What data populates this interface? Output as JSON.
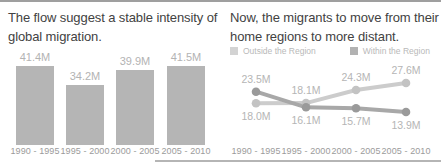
{
  "window": {
    "background": "#ffffff",
    "top_rule_color": "#9f9f9f",
    "bottom_rule_color": "#b5b5b5",
    "title_color": "#424242"
  },
  "chart_data": [
    {
      "type": "bar",
      "title": "The flow suggest a stable intensity of global migration.",
      "categories": [
        "1990 - 1995",
        "1995 - 2000",
        "2000 - 2005",
        "2005 - 2010"
      ],
      "values": [
        41.4,
        34.2,
        39.9,
        41.5
      ],
      "value_labels": [
        "41.4M",
        "34.2M",
        "39.9M",
        "41.5M"
      ],
      "unit": "M",
      "bar_color": "#b5b5b5",
      "label_color": "#b3b3b3",
      "axis_label_color": "#9b9b9b",
      "grid": false,
      "y_axis_shown": false
    },
    {
      "type": "line",
      "title": "Now, the migrants to move from their home regions to more distant.",
      "categories": [
        "1990 - 1995",
        "1995 - 2000",
        "2000 - 2005",
        "2005 - 2010"
      ],
      "legend_position": "top",
      "legend": [
        {
          "name": "Outside the Region",
          "color": "#d3d3d3"
        },
        {
          "name": "Within the Region",
          "color": "#b2b2b2"
        }
      ],
      "value_label_color": "#b5b5b5",
      "axis_label_color": "#9b9b9b",
      "grid": false,
      "series": [
        {
          "name": "Outside the Region",
          "values": [
            18.0,
            18.1,
            24.3,
            27.6
          ],
          "value_labels": [
            "18.0M",
            "18.1M",
            "24.3M",
            "27.6M"
          ],
          "line_color": "#cccccc",
          "point_color": "#c3c3c3",
          "label_side": [
            "below",
            "above",
            "above",
            "above"
          ]
        },
        {
          "name": "Within the Region",
          "values": [
            23.5,
            16.1,
            15.7,
            13.9
          ],
          "value_labels": [
            "23.5M",
            "16.1M",
            "15.7M",
            "13.9M"
          ],
          "line_color": "#a8a8a8",
          "point_color": "#9a9a9a",
          "label_side": [
            "above",
            "below",
            "below",
            "below"
          ]
        }
      ]
    }
  ]
}
